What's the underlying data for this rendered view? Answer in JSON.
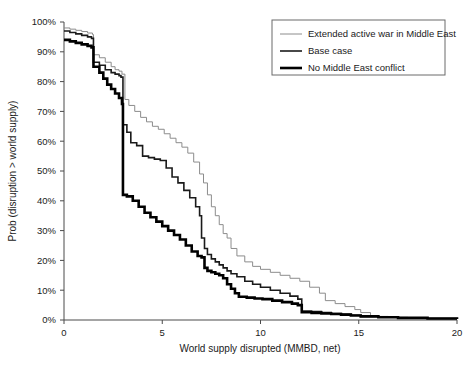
{
  "chart_data": {
    "type": "line",
    "title": "",
    "xlabel": "World supply disrupted (MMBD, net)",
    "ylabel": "Prob (disruption > world supply)",
    "xlim": [
      0,
      20
    ],
    "ylim": [
      0,
      100
    ],
    "grid": false,
    "legend_position": "top-right",
    "xticks": [
      0,
      5,
      10,
      15,
      20
    ],
    "xtick_labels": [
      "0",
      "5",
      "10",
      "15",
      "20"
    ],
    "yticks": [
      0,
      10,
      20,
      30,
      40,
      50,
      60,
      70,
      80,
      90,
      100
    ],
    "ytick_labels": [
      "0%",
      "10%",
      "20%",
      "30%",
      "40%",
      "50%",
      "60%",
      "70%",
      "80%",
      "90%",
      "100%"
    ],
    "step_style": "post",
    "series": [
      {
        "name": "Extended active war in Middle East",
        "color": "#8c8c8c",
        "stroke_width": 1.0,
        "x": [
          0.0,
          0.3,
          0.6,
          0.9,
          1.2,
          1.45,
          1.5,
          1.8,
          2.1,
          2.4,
          2.6,
          2.8,
          2.95,
          3.1,
          3.3,
          3.6,
          3.9,
          4.2,
          4.5,
          4.8,
          5.1,
          5.4,
          5.7,
          6.0,
          6.3,
          6.6,
          6.9,
          7.1,
          7.3,
          7.5,
          7.7,
          7.9,
          8.1,
          8.3,
          8.5,
          8.8,
          9.2,
          9.6,
          10.0,
          10.5,
          11.0,
          11.5,
          12.0,
          12.5,
          13.0,
          13.3,
          13.8,
          14.3,
          14.8,
          15.1,
          15.6,
          16.5,
          17.5,
          18.5,
          20.0
        ],
        "y": [
          98.0,
          97.6,
          97.2,
          96.8,
          96.3,
          95.8,
          89.0,
          88.0,
          86.5,
          85.0,
          84.0,
          83.5,
          82.5,
          74.0,
          72.0,
          70.0,
          68.0,
          66.5,
          65.0,
          64.0,
          62.5,
          61.0,
          59.5,
          58.0,
          56.0,
          53.0,
          49.0,
          46.0,
          42.0,
          38.0,
          35.0,
          32.0,
          29.0,
          27.5,
          24.0,
          21.5,
          19.5,
          18.0,
          17.0,
          16.0,
          15.0,
          14.0,
          13.0,
          11.0,
          9.0,
          6.5,
          5.5,
          4.5,
          3.5,
          2.5,
          1.2,
          0.9,
          0.7,
          0.5,
          0.3
        ]
      },
      {
        "name": "Base case",
        "color": "#1a1a1a",
        "stroke_width": 1.6,
        "x": [
          0.0,
          0.3,
          0.6,
          0.9,
          1.2,
          1.4,
          1.5,
          1.8,
          2.1,
          2.4,
          2.6,
          2.8,
          2.9,
          3.0,
          3.2,
          3.4,
          3.7,
          4.0,
          4.3,
          4.6,
          4.9,
          5.2,
          5.5,
          5.8,
          6.1,
          6.4,
          6.7,
          6.9,
          7.0,
          7.15,
          7.3,
          7.5,
          7.7,
          7.9,
          8.1,
          8.3,
          8.5,
          8.8,
          9.2,
          9.6,
          10.0,
          10.5,
          11.0,
          11.5,
          11.9,
          12.1,
          12.6,
          13.1,
          13.6,
          14.1,
          14.6,
          15.1,
          16.0,
          17.0,
          18.5,
          20.0
        ],
        "y": [
          97.0,
          96.5,
          96.0,
          95.5,
          95.0,
          94.5,
          86.5,
          85.5,
          84.0,
          83.0,
          82.5,
          82.0,
          81.5,
          65.5,
          63.0,
          59.5,
          58.5,
          55.0,
          54.5,
          54.0,
          53.5,
          51.0,
          48.0,
          46.0,
          43.5,
          41.0,
          38.0,
          35.0,
          27.5,
          24.0,
          22.0,
          20.5,
          19.5,
          18.5,
          17.5,
          16.5,
          15.5,
          14.5,
          13.0,
          12.0,
          11.0,
          10.0,
          9.0,
          8.0,
          7.0,
          3.0,
          2.8,
          2.5,
          2.2,
          1.9,
          1.6,
          1.2,
          0.9,
          0.7,
          0.5,
          0.3
        ]
      },
      {
        "name": "No Middle East conflict",
        "color": "#000000",
        "stroke_width": 2.6,
        "x": [
          0.0,
          0.3,
          0.6,
          0.9,
          1.2,
          1.4,
          1.5,
          1.8,
          2.0,
          2.2,
          2.4,
          2.6,
          2.8,
          2.95,
          3.0,
          3.2,
          3.5,
          3.8,
          4.1,
          4.4,
          4.7,
          5.0,
          5.3,
          5.6,
          5.9,
          6.2,
          6.5,
          6.8,
          7.0,
          7.15,
          7.3,
          7.5,
          7.7,
          7.9,
          8.1,
          8.3,
          8.5,
          8.7,
          8.9,
          9.3,
          9.7,
          10.1,
          10.6,
          11.1,
          11.6,
          11.9,
          12.1,
          12.6,
          13.1,
          13.6,
          14.1,
          14.6,
          15.1,
          16.0,
          17.0,
          18.5,
          20.0
        ],
        "y": [
          94.0,
          93.5,
          93.0,
          92.5,
          92.0,
          91.5,
          85.0,
          83.0,
          81.0,
          79.0,
          77.5,
          76.0,
          74.5,
          72.5,
          42.0,
          41.5,
          40.0,
          38.0,
          36.0,
          34.5,
          33.0,
          31.5,
          30.0,
          28.5,
          27.0,
          25.0,
          23.0,
          21.5,
          21.0,
          17.5,
          16.5,
          16.0,
          15.5,
          15.0,
          14.0,
          12.0,
          10.5,
          9.0,
          7.8,
          7.5,
          7.2,
          7.0,
          6.5,
          6.0,
          5.5,
          5.0,
          2.6,
          2.4,
          2.2,
          2.0,
          1.8,
          1.5,
          1.2,
          0.9,
          0.7,
          0.5,
          0.3
        ]
      }
    ]
  }
}
